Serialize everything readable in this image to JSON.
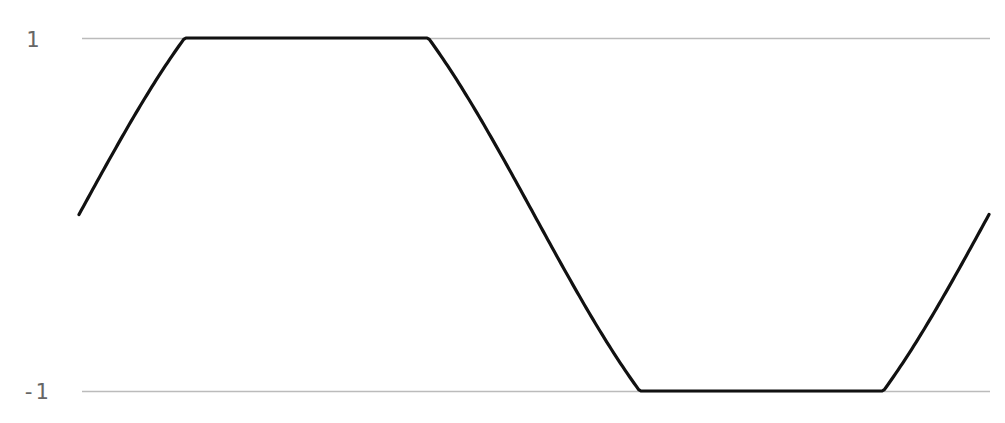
{
  "chart_data": {
    "type": "line",
    "title": "",
    "xlabel": "",
    "ylabel": "",
    "ylim": [
      -1,
      1
    ],
    "yticks": [
      "1",
      "-1"
    ],
    "grid": true,
    "amplitude_before_clip": 1.5,
    "x": [
      0.0,
      0.0714,
      0.1143,
      0.2,
      0.3,
      0.3857,
      0.4286,
      0.5,
      0.5714,
      0.6143,
      0.7,
      0.8,
      0.8857,
      0.9286,
      1.0
    ],
    "values": [
      0.0,
      0.63,
      1.0,
      1.0,
      1.0,
      1.0,
      0.93,
      0.0,
      -0.93,
      -1.0,
      -1.0,
      -1.0,
      -1.0,
      -0.63,
      0.0
    ],
    "series": [
      {
        "name": "clipped sine",
        "color": "#111111"
      }
    ],
    "gridline_color": "#bbbbbb"
  },
  "caption": {
    "text": ""
  },
  "axis": {
    "ytick_top": "1",
    "ytick_bottom": "-1"
  }
}
